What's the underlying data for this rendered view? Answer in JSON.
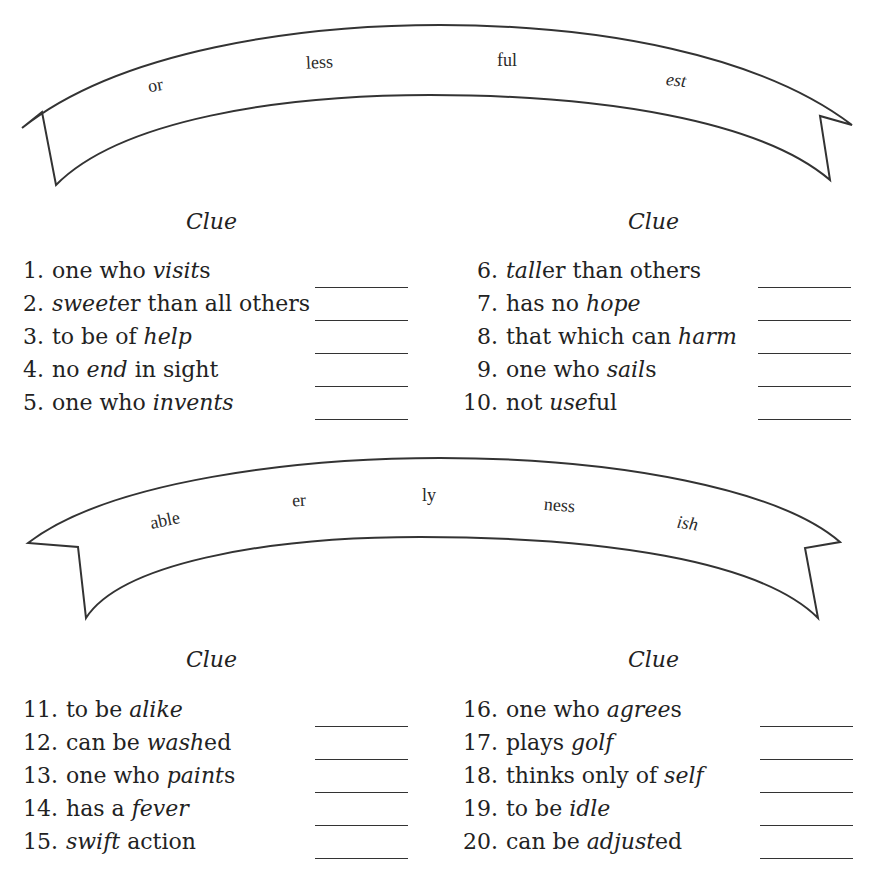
{
  "banners": [
    {
      "suffixes": [
        "or",
        "less",
        "ful",
        "est"
      ]
    },
    {
      "suffixes": [
        "able",
        "er",
        "ly",
        "ness",
        "ish"
      ]
    }
  ],
  "sections": [
    {
      "columns": [
        {
          "header": "Clue",
          "items": [
            {
              "num": "1.",
              "parts": [
                [
                  "one who ",
                  false
                ],
                [
                  "visit",
                  true
                ],
                [
                  "s",
                  false
                ]
              ]
            },
            {
              "num": "2.",
              "parts": [
                [
                  "sweet",
                  true
                ],
                [
                  "er than all others",
                  false
                ]
              ]
            },
            {
              "num": "3.",
              "parts": [
                [
                  "to be of ",
                  false
                ],
                [
                  "help",
                  true
                ]
              ]
            },
            {
              "num": "4.",
              "parts": [
                [
                  "no ",
                  false
                ],
                [
                  "end",
                  true
                ],
                [
                  " in sight",
                  false
                ]
              ]
            },
            {
              "num": "5.",
              "parts": [
                [
                  "one who ",
                  false
                ],
                [
                  "invents",
                  true
                ]
              ]
            }
          ]
        },
        {
          "header": "Clue",
          "items": [
            {
              "num": "6.",
              "parts": [
                [
                  "tall",
                  true
                ],
                [
                  "er than others",
                  false
                ]
              ]
            },
            {
              "num": "7.",
              "parts": [
                [
                  "has no ",
                  false
                ],
                [
                  "hope",
                  true
                ]
              ]
            },
            {
              "num": "8.",
              "parts": [
                [
                  "that which can ",
                  false
                ],
                [
                  "harm",
                  true
                ]
              ]
            },
            {
              "num": "9.",
              "parts": [
                [
                  "one who ",
                  false
                ],
                [
                  "sail",
                  true
                ],
                [
                  "s",
                  false
                ]
              ]
            },
            {
              "num": "10.",
              "parts": [
                [
                  "not ",
                  false
                ],
                [
                  "use",
                  true
                ],
                [
                  "ful",
                  false
                ]
              ]
            }
          ]
        }
      ]
    },
    {
      "columns": [
        {
          "header": "Clue",
          "items": [
            {
              "num": "11.",
              "parts": [
                [
                  "to be ",
                  false
                ],
                [
                  "alike",
                  true
                ]
              ]
            },
            {
              "num": "12.",
              "parts": [
                [
                  "can be ",
                  false
                ],
                [
                  "wash",
                  true
                ],
                [
                  "ed",
                  false
                ]
              ]
            },
            {
              "num": "13.",
              "parts": [
                [
                  "one who ",
                  false
                ],
                [
                  "paint",
                  true
                ],
                [
                  "s",
                  false
                ]
              ]
            },
            {
              "num": "14.",
              "parts": [
                [
                  "has a ",
                  false
                ],
                [
                  "fever",
                  true
                ]
              ]
            },
            {
              "num": "15.",
              "parts": [
                [
                  "swift",
                  true
                ],
                [
                  " action",
                  false
                ]
              ]
            }
          ]
        },
        {
          "header": "Clue",
          "items": [
            {
              "num": "16.",
              "parts": [
                [
                  "one who ",
                  false
                ],
                [
                  "agree",
                  true
                ],
                [
                  "s",
                  false
                ]
              ]
            },
            {
              "num": "17.",
              "parts": [
                [
                  "plays ",
                  false
                ],
                [
                  "golf",
                  true
                ]
              ]
            },
            {
              "num": "18.",
              "parts": [
                [
                  "thinks only of ",
                  false
                ],
                [
                  "self",
                  true
                ]
              ]
            },
            {
              "num": "19.",
              "parts": [
                [
                  "to be ",
                  false
                ],
                [
                  "idle",
                  true
                ]
              ]
            },
            {
              "num": "20.",
              "parts": [
                [
                  "can be ",
                  false
                ],
                [
                  "adjust",
                  true
                ],
                [
                  "ed",
                  false
                ]
              ]
            }
          ]
        }
      ]
    }
  ]
}
